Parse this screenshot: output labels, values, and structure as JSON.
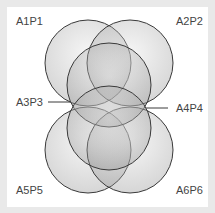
{
  "diagram": {
    "type": "venn-six-circles",
    "labels": {
      "a1p1": "A1P1",
      "a2p2": "A2P2",
      "a3p3": "A3P3",
      "a4p4": "A4P4",
      "a5p5": "A5P5",
      "a6p6": "A6P6"
    },
    "colors": {
      "stroke": "#3a3a3a",
      "fill": "#9a9a9a",
      "background": "#e9e9e9",
      "panel": "#ffffff"
    }
  }
}
